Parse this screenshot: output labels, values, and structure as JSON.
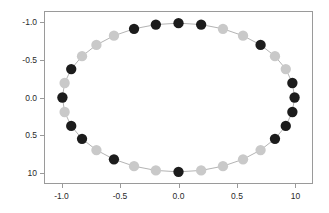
{
  "chart_data": {
    "type": "scatter",
    "title": "",
    "subtitle": "",
    "xlabel": "",
    "ylabel": "",
    "xlim": [
      -1.15,
      1.15
    ],
    "ylim": [
      -1.15,
      1.15
    ],
    "grid": false,
    "legend": null,
    "xticks": [
      -1.0,
      -0.5,
      0.0,
      0.5,
      1.0
    ],
    "yticks": [
      -1.0,
      -0.5,
      0.0,
      0.5,
      1.0
    ],
    "xtick_labels": [
      "-1.0",
      "-0.5",
      "0.0",
      "0.5",
      "10"
    ],
    "ytick_labels": [
      "10",
      "0.5",
      "0.0",
      "-0.5",
      "-1.0"
    ],
    "marker_colors": {
      "dark": "#1c1c1c",
      "light": "#c9c9c9"
    },
    "line_color": "#aaaaaa",
    "frame_color": "#9a9a9a",
    "background": "#ffffff",
    "marker_radius_px": 5.2,
    "connected": true,
    "series": [
      {
        "name": "circle-points",
        "points": [
          {
            "x": 1.0,
            "y": 0.0,
            "color": "dark"
          },
          {
            "x": 0.981,
            "y": 0.195,
            "color": "dark"
          },
          {
            "x": 0.924,
            "y": 0.383,
            "color": "light"
          },
          {
            "x": 0.831,
            "y": 0.556,
            "color": "light"
          },
          {
            "x": 0.707,
            "y": 0.707,
            "color": "dark"
          },
          {
            "x": 0.556,
            "y": 0.831,
            "color": "light"
          },
          {
            "x": 0.383,
            "y": 0.924,
            "color": "light"
          },
          {
            "x": 0.195,
            "y": 0.981,
            "color": "dark"
          },
          {
            "x": 0.0,
            "y": 1.0,
            "color": "dark"
          },
          {
            "x": -0.195,
            "y": 0.981,
            "color": "dark"
          },
          {
            "x": -0.383,
            "y": 0.924,
            "color": "dark"
          },
          {
            "x": -0.556,
            "y": 0.831,
            "color": "light"
          },
          {
            "x": -0.707,
            "y": 0.707,
            "color": "light"
          },
          {
            "x": -0.831,
            "y": 0.556,
            "color": "light"
          },
          {
            "x": -0.924,
            "y": 0.383,
            "color": "dark"
          },
          {
            "x": -0.981,
            "y": 0.195,
            "color": "light"
          },
          {
            "x": -1.0,
            "y": 0.0,
            "color": "dark"
          },
          {
            "x": -0.981,
            "y": -0.195,
            "color": "light"
          },
          {
            "x": -0.924,
            "y": -0.383,
            "color": "dark"
          },
          {
            "x": -0.831,
            "y": -0.556,
            "color": "dark"
          },
          {
            "x": -0.707,
            "y": -0.707,
            "color": "light"
          },
          {
            "x": -0.556,
            "y": -0.831,
            "color": "dark"
          },
          {
            "x": -0.383,
            "y": -0.924,
            "color": "light"
          },
          {
            "x": -0.195,
            "y": -0.981,
            "color": "light"
          },
          {
            "x": 0.0,
            "y": -1.0,
            "color": "dark"
          },
          {
            "x": 0.195,
            "y": -0.981,
            "color": "light"
          },
          {
            "x": 0.383,
            "y": -0.924,
            "color": "light"
          },
          {
            "x": 0.556,
            "y": -0.831,
            "color": "light"
          },
          {
            "x": 0.707,
            "y": -0.707,
            "color": "light"
          },
          {
            "x": 0.831,
            "y": -0.556,
            "color": "dark"
          },
          {
            "x": 0.924,
            "y": -0.383,
            "color": "dark"
          },
          {
            "x": 0.981,
            "y": -0.195,
            "color": "dark"
          }
        ]
      }
    ]
  }
}
